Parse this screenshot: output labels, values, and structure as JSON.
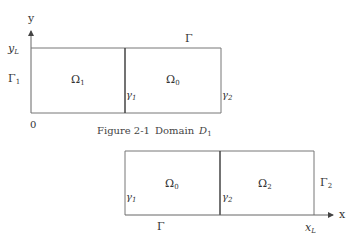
{
  "figure": {
    "caption_prefix": "Figure 2-1",
    "caption_word": "Domain",
    "caption_symbol": "D",
    "caption_sub": "1"
  },
  "axes": {
    "y_label": "y",
    "x_label": "x",
    "origin_label": "0",
    "y_tick": "y",
    "y_tick_sub": "L",
    "x_tick": "x",
    "x_tick_sub": "L"
  },
  "top_domain": {
    "boundary_top": "Γ",
    "boundary_left": "Γ",
    "boundary_left_sub": "1",
    "region_left": "Ω",
    "region_left_sub": "1",
    "region_right": "Ω",
    "region_right_sub": "0",
    "interface_mid": "γ",
    "interface_mid_sub": "1",
    "interface_right": "γ",
    "interface_right_sub": "2"
  },
  "bottom_domain": {
    "boundary_bottom": "Γ",
    "boundary_right": "Γ",
    "boundary_right_sub": "2",
    "region_left": "Ω",
    "region_left_sub": "0",
    "region_right": "Ω",
    "region_right_sub": "2",
    "interface_left": "γ",
    "interface_left_sub": "1",
    "interface_mid": "γ",
    "interface_mid_sub": "2"
  },
  "colors": {
    "line": "#666666",
    "divider": "#444444",
    "text": "#333333"
  }
}
